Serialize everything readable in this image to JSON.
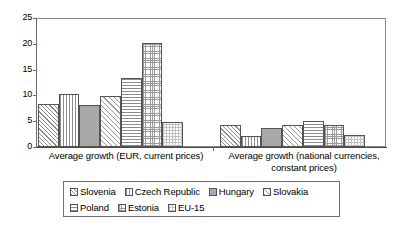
{
  "chart_data": {
    "type": "bar",
    "title": "",
    "subtitle": "",
    "xlabel": "",
    "ylabel": "",
    "ylim": [
      0,
      25
    ],
    "yticks": [
      0,
      5,
      10,
      15,
      20,
      25
    ],
    "grid": false,
    "legend_position": "bottom",
    "categories": [
      "Average growth (EUR, current prices)",
      "Average growth (national currencies,\nconstant prices)"
    ],
    "series": [
      {
        "name": "Slovenia",
        "pattern": "diagonal-hatch",
        "values": [
          8.3,
          4.3
        ]
      },
      {
        "name": "Czech Republic",
        "pattern": "vertical-lines",
        "values": [
          10.3,
          2.1
        ]
      },
      {
        "name": "Hungary",
        "pattern": "solid-gray",
        "values": [
          8.2,
          3.6
        ]
      },
      {
        "name": "Slovakia",
        "pattern": "diagonal-wide",
        "values": [
          9.9,
          4.3
        ]
      },
      {
        "name": "Poland",
        "pattern": "horizontal-lines",
        "values": [
          13.3,
          5.0
        ]
      },
      {
        "name": "Estonia",
        "pattern": "fine-grid",
        "values": [
          20.2,
          4.2
        ]
      },
      {
        "name": "EU-15",
        "pattern": "light-checker",
        "values": [
          4.8,
          2.3
        ]
      }
    ]
  },
  "axis": {
    "y_tick_labels": [
      "0",
      "5",
      "10",
      "15",
      "20",
      "25"
    ]
  },
  "legend": {
    "row1": [
      "Slovenia",
      "Czech Republic",
      "Hungary",
      "Slovakia"
    ],
    "row2": [
      "Poland",
      "Estonia",
      "EU-15"
    ]
  }
}
